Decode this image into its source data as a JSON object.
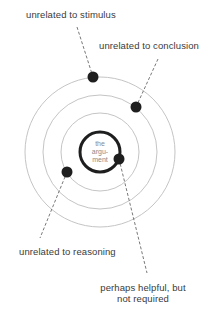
{
  "diagram": {
    "center_label": [
      "the",
      "argu-",
      "ment"
    ],
    "labels": {
      "stimulus": "unrelated to stimulus",
      "conclusion": "unrelated to conclusion",
      "reasoning": "unrelated to reasoning",
      "helpful_line1": "perhaps helpful, but",
      "helpful_line2": "not required"
    },
    "rings": [
      {
        "name": "argument",
        "radius": 20
      },
      {
        "name": "reasoning-ring",
        "radius": 39
      },
      {
        "name": "conclusion-ring",
        "radius": 57
      },
      {
        "name": "stimulus-ring",
        "radius": 75
      }
    ],
    "colors": {
      "ring": "#b8b8b8",
      "argument_ring": "#1e1e1e",
      "dot": "#1e1e1e",
      "leader": "#555555",
      "text": "#3a3a3a"
    }
  }
}
